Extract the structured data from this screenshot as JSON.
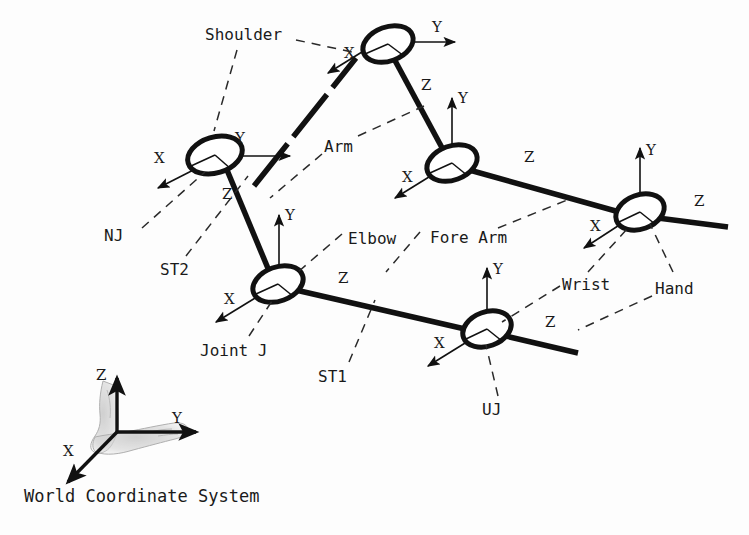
{
  "figure": {
    "background_color": "#fdfdfd",
    "ink_color": "#111111"
  },
  "world_frame": {
    "caption": "World Coordinate System",
    "axis_z": "Z",
    "axis_y": "Y",
    "axis_x": "X",
    "icon": "foot-icon"
  },
  "joints": [
    {
      "id": "nj",
      "callout": "NJ",
      "axis_x": "X",
      "axis_y": "Y",
      "axis_z": "Z"
    },
    {
      "id": "shoulder",
      "callout": "Shoulder",
      "axis_x": "X",
      "axis_y": "Y",
      "axis_z": "Z"
    },
    {
      "id": "elbow",
      "callout": "Elbow",
      "axis_x": "X",
      "axis_y": "Y",
      "axis_z": "Z"
    },
    {
      "id": "jointj",
      "callout": "Joint J",
      "axis_x": "X",
      "axis_y": "Y",
      "axis_z": "Z"
    },
    {
      "id": "uj",
      "callout": "UJ",
      "axis_x": "X",
      "axis_y": "Y",
      "axis_z": "Z"
    },
    {
      "id": "hand",
      "callout": "Hand",
      "axis_x": "X",
      "axis_y": "Y",
      "axis_z": "Z"
    }
  ],
  "links": [
    {
      "id": "arm",
      "callout": "Arm"
    },
    {
      "id": "forearm",
      "callout": "Fore Arm"
    },
    {
      "id": "st1",
      "callout": "ST1"
    },
    {
      "id": "st2",
      "callout": "ST2"
    },
    {
      "id": "wrist",
      "callout": "Wrist"
    }
  ],
  "labels": {
    "shoulder": "Shoulder",
    "arm": "Arm",
    "nj": "NJ",
    "st2": "ST2",
    "elbow": "Elbow",
    "fore_arm": "Fore Arm",
    "wrist": "Wrist",
    "hand": "Hand",
    "joint_j": "Joint J",
    "st1": "ST1",
    "uj": "UJ",
    "world_coordinate_system": "World Coordinate System"
  },
  "axis_letters": {
    "x": "X",
    "y": "Y",
    "z": "Z"
  }
}
